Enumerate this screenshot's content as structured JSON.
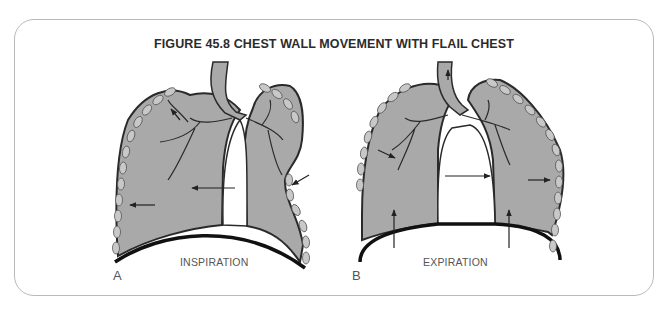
{
  "figure": {
    "title": "FIGURE 45.8 CHEST WALL MOVEMENT WITH FLAIL CHEST",
    "panels": [
      {
        "letter": "A",
        "phase_label": "INSPIRATION"
      },
      {
        "letter": "B",
        "phase_label": "EXPIRATION"
      }
    ]
  },
  "colors": {
    "lung_fill": "#a9a9a9",
    "outline": "#2a2a2a",
    "rib_fill": "#c8c8c8",
    "card_border": "#b9b9b9"
  }
}
